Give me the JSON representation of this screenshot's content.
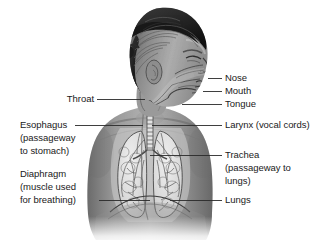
{
  "figure": {
    "background_color": "#ffffff",
    "text_color": "#1a1a1a",
    "leader_line_color": "#2a2a2a"
  },
  "labels": {
    "left": [
      {
        "name": "throat",
        "lines": [
          "Throat"
        ]
      },
      {
        "name": "esophagus",
        "lines": [
          "Esophagus",
          "(passageway",
          "to stomach)"
        ]
      },
      {
        "name": "diaphragm",
        "lines": [
          "Diaphragm",
          "(muscle used",
          "for breathing)"
        ]
      }
    ],
    "right": [
      {
        "name": "nose",
        "lines": [
          "Nose"
        ]
      },
      {
        "name": "mouth",
        "lines": [
          "Mouth"
        ]
      },
      {
        "name": "tongue",
        "lines": [
          "Tongue"
        ]
      },
      {
        "name": "larynx",
        "lines": [
          "Larynx (vocal cords)"
        ]
      },
      {
        "name": "trachea",
        "lines": [
          "Trachea",
          "(passageway to",
          "lungs)"
        ]
      },
      {
        "name": "lungs",
        "lines": [
          "Lungs"
        ]
      }
    ]
  },
  "text": {
    "throat": "Throat",
    "esophagus_1": "Esophagus",
    "esophagus_2": "(passageway",
    "esophagus_3": "to stomach)",
    "diaphragm_1": "Diaphragm",
    "diaphragm_2": "(muscle used",
    "diaphragm_3": "for breathing)",
    "nose": "Nose",
    "mouth": "Mouth",
    "tongue": "Tongue",
    "larynx": "Larynx (vocal cords)",
    "trachea_1": "Trachea",
    "trachea_2": "(passageway to",
    "trachea_3": "lungs)",
    "lungs": "Lungs"
  }
}
